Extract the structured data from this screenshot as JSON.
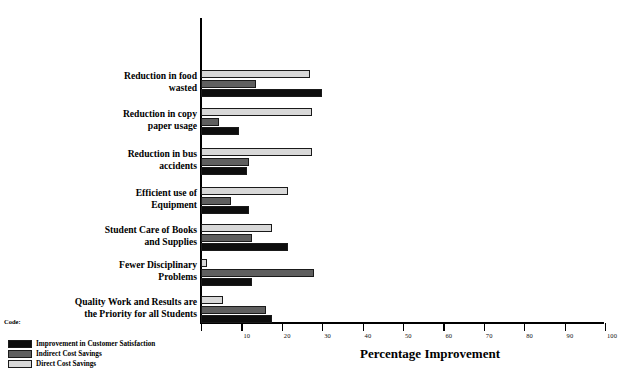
{
  "chart_data": {
    "type": "bar",
    "orientation": "horizontal",
    "title": "",
    "xlabel": "Percentage Improvement",
    "ylabel": "",
    "xlim": [
      0,
      100
    ],
    "xticks": [
      0,
      10,
      20,
      30,
      40,
      50,
      60,
      70,
      80,
      90,
      100
    ],
    "xticklabels": [
      "",
      "10",
      "20",
      "30",
      "40",
      "50",
      "60",
      "70",
      "80",
      "90",
      "100"
    ],
    "grid": false,
    "legend_position": "bottom-left",
    "legend_caption": "Code:",
    "categories": [
      "Reduction in food wasted",
      "Reduction in copy paper usage",
      "Reduction in bus accidents",
      "Efficient use of Equipment",
      "Student Care of Books and Supplies",
      "Fewer Disciplinary Problems",
      "Quality Work and Results are the Priority for all Students"
    ],
    "series": [
      {
        "name": "Direct Cost  Savings",
        "color": "#d8d8d8",
        "values": [
          27,
          27.5,
          27.5,
          21.5,
          17.5,
          1.5,
          5.5
        ]
      },
      {
        "name": "Indirect Cost Savings",
        "color": "#5f5f5f",
        "values": [
          13.5,
          4.5,
          12,
          7.5,
          12.5,
          28,
          16
        ]
      },
      {
        "name": "Improvement in Customer Satisfaction",
        "color": "#0d0d0d",
        "values": [
          30,
          9.5,
          11.5,
          12,
          21.5,
          12.5,
          17.5
        ]
      }
    ]
  },
  "axis": {
    "x_title": "Percentage Improvement"
  },
  "legend": {
    "caption": "Code:",
    "items": [
      {
        "label": "Improvement in Customer Satisfaction",
        "swatch": "dark"
      },
      {
        "label": "Indirect Cost Savings",
        "swatch": "mid"
      },
      {
        "label": "Direct Cost  Savings",
        "swatch": "light"
      }
    ]
  },
  "category_labels": [
    {
      "line1": "Reduction in food",
      "line2": "wasted"
    },
    {
      "line1": "Reduction in copy",
      "line2": "paper usage"
    },
    {
      "line1": "Reduction in bus",
      "line2": "accidents"
    },
    {
      "line1": "Efficient use of",
      "line2": "Equipment"
    },
    {
      "line1": "Student Care of Books",
      "line2": "and Supplies"
    },
    {
      "line1": "Fewer Disciplinary",
      "line2": "Problems"
    },
    {
      "line1": "Quality Work and Results are",
      "line2": "the Priority for all Students"
    }
  ],
  "ticks": [
    {
      "value": 0,
      "label": ""
    },
    {
      "value": 10,
      "label": "10"
    },
    {
      "value": 20,
      "label": "20"
    },
    {
      "value": 30,
      "label": "30"
    },
    {
      "value": 40,
      "label": "40"
    },
    {
      "value": 50,
      "label": "50"
    },
    {
      "value": 60,
      "label": "60"
    },
    {
      "value": 70,
      "label": "70"
    },
    {
      "value": 80,
      "label": "80"
    },
    {
      "value": 90,
      "label": "90"
    },
    {
      "value": 100,
      "label": "100"
    }
  ]
}
